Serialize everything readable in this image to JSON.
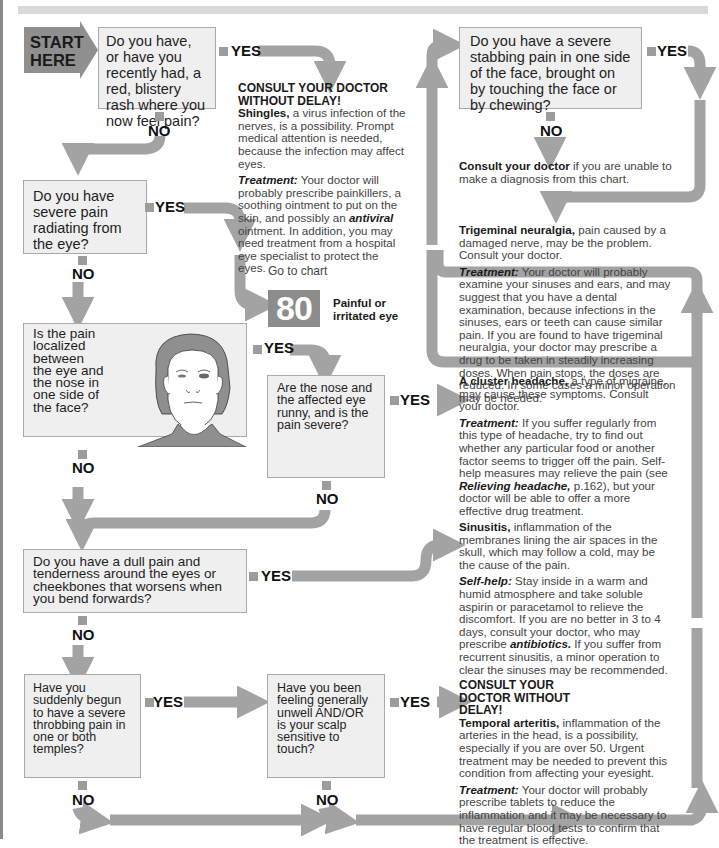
{
  "flowchart": {
    "start_label": [
      "START",
      "HERE"
    ],
    "yes_label": "YES",
    "no_label": "NO",
    "questions": [
      {
        "id": "q1",
        "text": "Do you have, or have you recently had, a red, blistery rash where you now feel pain?"
      },
      {
        "id": "q2",
        "text": "Do you have severe pain radiating from the eye?"
      },
      {
        "id": "q3",
        "text": "Is the pain localized between the eye and the nose in one side of the face?"
      },
      {
        "id": "q4",
        "text": "Are the nose and the affected eye runny, and is the pain severe?"
      },
      {
        "id": "q5",
        "text": "Do you have a dull pain and tenderness around the eyes or cheekbones that worsens when you bend forwards?"
      },
      {
        "id": "q6",
        "text": "Have you suddenly begun to have a severe throbbing pain in one or both temples?"
      },
      {
        "id": "q7",
        "text": "Have you been feeling generally unwell AND/OR is your scalp sensitive to touch?"
      },
      {
        "id": "q8",
        "text": "Do you have a severe stabbing pain in one side of the face, brought on by touching the face or by chewing?"
      }
    ],
    "outcomes": {
      "shingles": {
        "urgent": "CONSULT YOUR DOCTOR WITHOUT DELAY!",
        "title": "Shingles,",
        "body": "a virus infection of the nerves, is a possibility. Prompt medical attention is needed, because the infection may affect eyes.",
        "treatment_label": "Treatment:",
        "treatment_pre": "Your doctor will probably prescribe painkillers, a soothing ointment to put on the skin, and possibly an",
        "treatment_em": "antiviral",
        "treatment_post": "ointment. In addition, you may need treatment from a hospital eye specialist to protect the eyes."
      },
      "goto_chart": {
        "prefix": "Go to chart",
        "number": "80",
        "title_line1": "Painful or",
        "title_line2": "irritated eye"
      },
      "consult_fallback": {
        "bold": "Consult your doctor",
        "rest": "if you are unable to make a diagnosis from this chart."
      },
      "trigeminal": {
        "title": "Trigeminal neuralgia,",
        "body": "pain caused by a damaged nerve, may be the problem. Consult your doctor.",
        "treatment_label": "Treatment:",
        "treatment": "Your doctor will probably examine your sinuses and ears, and may suggest that you have a dental examination, because infections in the sinuses, ears or teeth can cause similar pain. If you are found to have trigeminal neuralgia, your doctor may prescribe a drug to be taken in steadily increasing doses. When pain stops, the doses are reduced. In some cases a minor operation may be needed."
      },
      "cluster": {
        "title": "A cluster headache,",
        "body": "a type of migraine, may cause these symptoms. Consult your doctor.",
        "treatment_label": "Treatment:",
        "treatment_pre": "If you suffer regularly from this type of headache, try to find out whether any particular food or another factor seems to trigger off the pain. Self-help measures may relieve the pain (see",
        "treatment_em": "Relieving headache,",
        "treatment_post": "p.162), but your doctor will be able to offer a more effective drug treatment."
      },
      "sinusitis": {
        "title": "Sinusitis,",
        "body": "inflammation of the membranes lining the air spaces in the skull, which may follow a cold, may be the cause of the pain.",
        "selfhelp_label": "Self-help:",
        "selfhelp_pre": "Stay inside in a warm and humid atmosphere and take soluble aspirin or paracetamol to relieve the discomfort. If you are no better in 3 to 4 days, consult your doctor, who may prescribe",
        "selfhelp_em": "antibiotics.",
        "selfhelp_post": "If you suffer from recurrent sinusitis, a minor operation to clear the sinuses may be recommended."
      },
      "temporal": {
        "urgent": "CONSULT YOUR DOCTOR WITHOUT DELAY!",
        "title": "Temporal arteritis,",
        "body": "inflammation of the arteries in the head, is a possibility, especially if you are over 50. Urgent treatment may be needed to prevent this condition from affecting your eyesight.",
        "treatment_label": "Treatment:",
        "treatment": "Your doctor will probably prescribe tablets to reduce the inflammation and it may be necessary to have regular blood tests to confirm that the treatment is effective."
      }
    },
    "colors": {
      "arrow": "#a3a3a3",
      "box_fill": "#efefef",
      "box_border": "#a9a9a9",
      "start_fill": "#8f8f8f",
      "chart_badge": "#8c8c8c"
    }
  }
}
